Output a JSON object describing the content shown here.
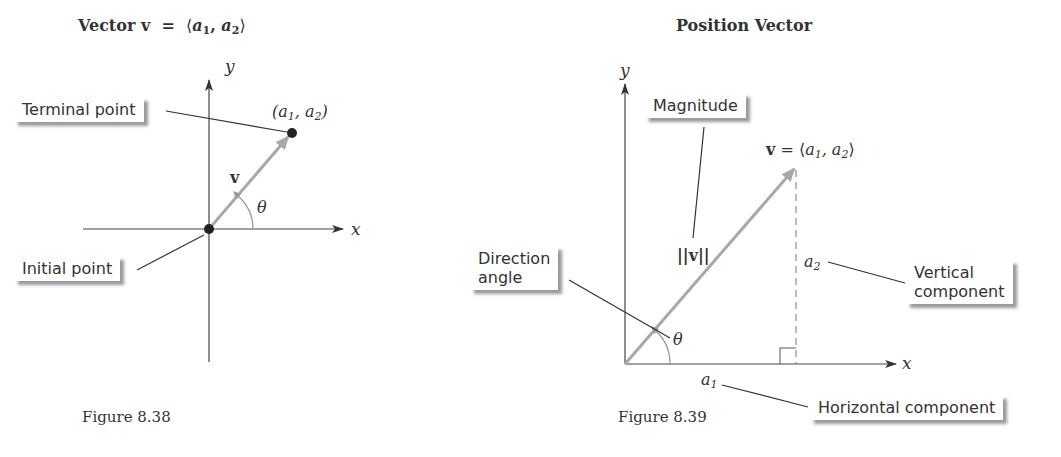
{
  "figure_1": {
    "title": "Vector v = ⟨a₁, a₂⟩",
    "title_parts": {
      "word": "Vector",
      "v": "v",
      "eq": "=",
      "open": "⟨",
      "a": "a",
      "s1": "1",
      "comma": ",",
      "s2": "2",
      "close": "⟩"
    },
    "axis_x": "x",
    "axis_y": "y",
    "terminal_point_label": "Terminal point",
    "initial_point_label": "Initial point",
    "point_label": {
      "open": "(",
      "a": "a",
      "s1": "1",
      "comma": ", ",
      "s2": "2",
      "close": ")"
    },
    "vector_label": "v",
    "angle_label": "θ",
    "caption": "Figure 8.38"
  },
  "figure_2": {
    "title": "Position Vector",
    "axis_x": "x",
    "axis_y": "y",
    "magnitude_label": "Magnitude",
    "magnitude_symbol": "||v||",
    "vector_eq": {
      "v": "v",
      "eq": " = ⟨",
      "a": "a",
      "s1": "1",
      "comma": ", ",
      "s2": "2",
      "close": "⟩"
    },
    "direction_angle_label_line1": "Direction",
    "direction_angle_label_line2": "angle",
    "angle_label": "θ",
    "a2_label": {
      "a": "a",
      "s": "2"
    },
    "a1_label": {
      "a": "a",
      "s": "1"
    },
    "vertical_component_line1": "Vertical",
    "vertical_component_line2": "component",
    "horizontal_component_label": "Horizontal component",
    "caption": "Figure 8.39"
  },
  "colors": {
    "axis": "#333333",
    "vector": "#a8a8a8",
    "leader": "#333333",
    "shadow": "#9a9a9a"
  }
}
